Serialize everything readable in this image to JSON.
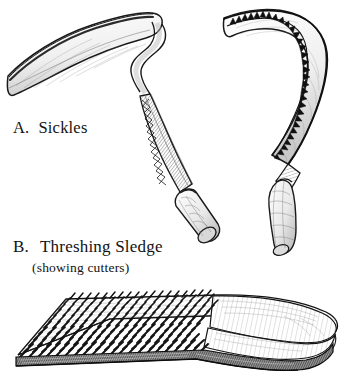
{
  "figure": {
    "background_color": "#ffffff",
    "ink_color": "#121212",
    "style": "pen-and-ink line engraving, black and white",
    "truncated_header_text": "",
    "items": [
      {
        "label": "A.",
        "title": "Sickles",
        "subtitle": "",
        "count": 2,
        "description": "Two curved hand sickles shown in three-quarter view"
      },
      {
        "label": "B.",
        "title": "Threshing Sledge",
        "subtitle": "(showing cutters)",
        "count": 1,
        "description": "Flat wooden board studded with rows of flint cutters, front end curved upward"
      }
    ]
  },
  "captions": {
    "a_label": "A.",
    "a_text": "Sickles",
    "b_label": "B.",
    "b_text": "Threshing  Sledge",
    "b_subtext": "(showing cutters)"
  },
  "drawings": {
    "sickle_left": {
      "name": "plain-blade sickle",
      "blade": "long smooth crescent blade hooking left to a fine point",
      "handle": "long tapered shaft with incised zigzag chevron ornament",
      "grip": "rounded cylindrical wooden grip at lower end",
      "tip_point": [
        8,
        76
      ]
    },
    "sickle_right": {
      "name": "serrated sickle",
      "blade": "hooked blade with sawtooth serrations along inner edge",
      "teeth_count": 34,
      "handle": "short tapering tang",
      "grip": "bulbous oval wooden grip",
      "tip_point": [
        224,
        18
      ]
    },
    "threshing_sledge": {
      "name": "threshing sledge (tribulum)",
      "board": "rectangular plank seen in perspective, front edge curled upward",
      "cutters": "dense diagonal rows of small angled flint cutters set in the underside",
      "cutter_rows": 12,
      "cutters_per_row": 22,
      "underside_edge": "dark striated band along the lower edge"
    }
  }
}
